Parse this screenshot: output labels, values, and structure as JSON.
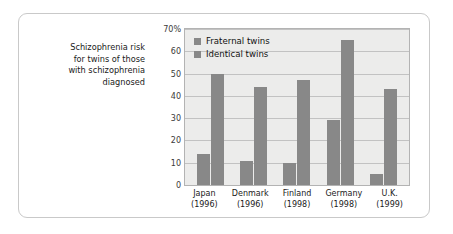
{
  "caption": {
    "lines": [
      "Schizophrenia risk",
      "for twins of those",
      "with schizophrenia",
      "diagnosed"
    ]
  },
  "chart_data": {
    "type": "bar",
    "title": "",
    "xlabel": "",
    "ylabel": "",
    "ylim": [
      0,
      70
    ],
    "yticks": [
      "0",
      "10",
      "20",
      "30",
      "40",
      "50",
      "60",
      "70%"
    ],
    "grid": true,
    "legend_position": "top-left-inside",
    "categories": [
      "Japan\n(1996)",
      "Denmark\n(1996)",
      "Finland\n(1998)",
      "Germany\n(1998)",
      "U.K.\n(1999)"
    ],
    "category_labels": [
      {
        "country": "Japan",
        "year": "(1996)"
      },
      {
        "country": "Denmark",
        "year": "(1996)"
      },
      {
        "country": "Finland",
        "year": "(1998)"
      },
      {
        "country": "Germany",
        "year": "(1998)"
      },
      {
        "country": "U.K.",
        "year": "(1999)"
      }
    ],
    "series": [
      {
        "name": "Fraternal twins",
        "color": "#888888",
        "values": [
          14,
          11,
          10,
          29,
          5
        ]
      },
      {
        "name": "Identical twins",
        "color": "#888888",
        "values": [
          50,
          44,
          47,
          65,
          43
        ]
      }
    ]
  },
  "colors": {
    "bar": "#888888",
    "plot_background": "#ececeb",
    "gridline": "#c2c2c2",
    "frame": "#c9c9c9",
    "text": "#1a1a1a"
  }
}
